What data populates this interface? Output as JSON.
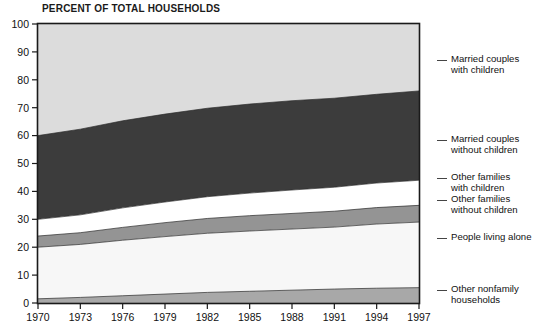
{
  "chart_data": {
    "type": "area",
    "title": "PERCENT OF TOTAL HOUSEHOLDS",
    "stacked": true,
    "xlabel": "",
    "ylabel": "",
    "xlim": [
      1970,
      1997
    ],
    "ylim": [
      0,
      100
    ],
    "grid": false,
    "legend_position": "right",
    "x": [
      1970,
      1973,
      1976,
      1979,
      1982,
      1985,
      1988,
      1991,
      1994,
      1997
    ],
    "xticks": [
      "1970",
      "1973",
      "1976",
      "1979",
      "1982",
      "1985",
      "1988",
      "1991",
      "1994",
      "1997"
    ],
    "yticks": [
      "0",
      "10",
      "20",
      "30",
      "40",
      "50",
      "60",
      "70",
      "80",
      "90",
      "100"
    ],
    "series": [
      {
        "name": "Other nonfamily households",
        "color": "#a8a8a8",
        "values": [
          1.5,
          2.0,
          2.6,
          3.2,
          3.8,
          4.2,
          4.6,
          5.0,
          5.3,
          5.5
        ]
      },
      {
        "name": "People living alone",
        "color": "#f5f5f5",
        "values": [
          18.5,
          19.0,
          19.9,
          20.6,
          21.2,
          21.6,
          21.9,
          22.2,
          23.0,
          23.5
        ]
      },
      {
        "name": "Other families without children",
        "color": "#949494",
        "values": [
          4.0,
          4.2,
          4.6,
          5.0,
          5.3,
          5.5,
          5.6,
          5.7,
          5.9,
          6.0
        ]
      },
      {
        "name": "Other families with children",
        "color": "#ffffff",
        "values": [
          6.0,
          6.4,
          7.0,
          7.4,
          7.8,
          8.1,
          8.4,
          8.6,
          8.8,
          9.0
        ]
      },
      {
        "name": "Married couples without children",
        "color": "#3c3c3c",
        "values": [
          30.0,
          30.7,
          31.2,
          31.5,
          31.7,
          31.9,
          32.0,
          31.9,
          31.8,
          32.0
        ]
      },
      {
        "name": "Married couples with children",
        "color": "#dcdcdc",
        "values": [
          40.0,
          37.7,
          34.7,
          32.3,
          30.2,
          28.7,
          27.5,
          26.6,
          25.2,
          24.0
        ]
      }
    ],
    "cumulative_top_boundaries": {
      "other_nonfamily": [
        1.5,
        2.0,
        2.6,
        3.2,
        3.8,
        4.2,
        4.6,
        5.0,
        5.3,
        5.5
      ],
      "people_living_alone": [
        20.0,
        21.0,
        22.5,
        23.8,
        25.0,
        25.8,
        26.5,
        27.2,
        28.3,
        29.0
      ],
      "other_families_without_children": [
        24.0,
        25.2,
        27.1,
        28.8,
        30.3,
        31.3,
        32.1,
        32.9,
        34.2,
        35.0
      ],
      "other_families_with_children": [
        30.0,
        31.6,
        34.1,
        36.2,
        38.1,
        39.4,
        40.5,
        41.5,
        43.0,
        44.0
      ],
      "married_couples_without_children": [
        60.0,
        62.3,
        65.3,
        67.7,
        69.8,
        71.3,
        72.5,
        73.4,
        74.8,
        76.0
      ],
      "married_couples_with_children": [
        100,
        100,
        100,
        100,
        100,
        100,
        100,
        100,
        100,
        100
      ]
    }
  },
  "legend": {
    "entries": [
      {
        "line1": "Married couples",
        "line2": "with children"
      },
      {
        "line1": "Married couples",
        "line2": "without children"
      },
      {
        "line1": "Other families",
        "line2": "with children"
      },
      {
        "line1": "Other families",
        "line2": "without children"
      },
      {
        "line1": "People living alone",
        "line2": ""
      },
      {
        "line1": "Other nonfamily",
        "line2": "households"
      }
    ]
  },
  "colors": {
    "band_married_with_children": "#dcdcdc",
    "band_married_without_children": "#3c3c3c",
    "band_other_families_with_children": "#ffffff",
    "band_other_families_without_children": "#949494",
    "band_people_living_alone": "#f7f7f7",
    "band_other_nonfamily": "#a8a8a8",
    "axis": "#1a1a1a",
    "text": "#111111"
  }
}
